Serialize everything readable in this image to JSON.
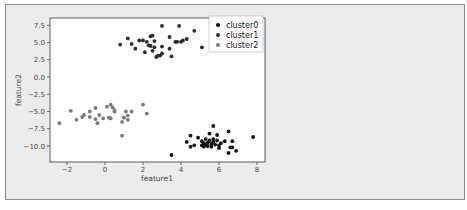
{
  "chart_data": {
    "type": "scatter",
    "title": "",
    "xlabel": "feature1",
    "ylabel": "feature2",
    "xlim": [
      -2.8,
      8.4
    ],
    "ylim": [
      -12.2,
      8.3
    ],
    "xticks": [
      -2,
      0,
      2,
      4,
      6,
      8
    ],
    "xtick_labels": [
      "−2",
      "0",
      "2",
      "4",
      "6",
      "8"
    ],
    "yticks": [
      7.5,
      5.0,
      2.5,
      0.0,
      -2.5,
      -5.0,
      -7.5,
      -10.0
    ],
    "ytick_labels": [
      "7.5",
      "5.0",
      "2.5",
      "0.0",
      "−2.5",
      "−5.0",
      "−7.5",
      "−10.0"
    ],
    "grid": false,
    "legend_position": "upper right",
    "series": [
      {
        "name": "cluster0",
        "color": "#111111",
        "points": [
          [
            3.5,
            -11.3
          ],
          [
            4.3,
            -9.4
          ],
          [
            4.5,
            -8.5
          ],
          [
            4.5,
            -10.1
          ],
          [
            4.7,
            -9.9
          ],
          [
            4.9,
            -8.8
          ],
          [
            5.1,
            -9.3
          ],
          [
            5.1,
            -9.9
          ],
          [
            5.2,
            -9.6
          ],
          [
            5.2,
            -10.1
          ],
          [
            5.3,
            -9.0
          ],
          [
            5.3,
            -9.8
          ],
          [
            5.4,
            -9.5
          ],
          [
            5.4,
            -10.0
          ],
          [
            5.5,
            -8.2
          ],
          [
            5.5,
            -9.2
          ],
          [
            5.6,
            -9.7
          ],
          [
            5.6,
            -10.1
          ],
          [
            5.7,
            -7.1
          ],
          [
            5.7,
            -9.0
          ],
          [
            5.7,
            -9.4
          ],
          [
            5.8,
            -9.8
          ],
          [
            5.9,
            -8.4
          ],
          [
            5.9,
            -9.2
          ],
          [
            6.0,
            -9.9
          ],
          [
            6.0,
            -10.3
          ],
          [
            6.1,
            -9.6
          ],
          [
            6.3,
            -9.3
          ],
          [
            6.5,
            -7.9
          ],
          [
            6.5,
            -11.0
          ],
          [
            6.6,
            -10.2
          ],
          [
            6.7,
            -9.3
          ],
          [
            6.7,
            -10.2
          ],
          [
            6.9,
            -10.7
          ],
          [
            7.8,
            -8.7
          ]
        ]
      },
      {
        "name": "cluster1",
        "color": "#2a2a2a",
        "points": [
          [
            0.8,
            4.7
          ],
          [
            1.2,
            5.6
          ],
          [
            1.4,
            4.8
          ],
          [
            1.6,
            4.1
          ],
          [
            1.8,
            5.3
          ],
          [
            2.0,
            5.3
          ],
          [
            2.1,
            3.6
          ],
          [
            2.2,
            5.1
          ],
          [
            2.3,
            4.6
          ],
          [
            2.4,
            5.9
          ],
          [
            2.4,
            4.5
          ],
          [
            2.5,
            6.0
          ],
          [
            2.5,
            3.8
          ],
          [
            2.6,
            4.3
          ],
          [
            2.6,
            5.2
          ],
          [
            2.7,
            2.9
          ],
          [
            2.8,
            3.1
          ],
          [
            2.9,
            3.1
          ],
          [
            3.0,
            3.4
          ],
          [
            3.0,
            4.4
          ],
          [
            3.0,
            7.4
          ],
          [
            3.4,
            5.8
          ],
          [
            3.4,
            4.1
          ],
          [
            3.5,
            3.0
          ],
          [
            3.7,
            5.1
          ],
          [
            3.8,
            5.1
          ],
          [
            3.9,
            7.4
          ],
          [
            4.0,
            5.1
          ],
          [
            4.1,
            5.3
          ],
          [
            4.3,
            5.5
          ],
          [
            4.7,
            6.7
          ],
          [
            5.1,
            4.3
          ]
        ]
      },
      {
        "name": "cluster2",
        "color": "#7a7a7a",
        "points": [
          [
            -2.4,
            -6.7
          ],
          [
            -1.8,
            -4.9
          ],
          [
            -1.5,
            -6.2
          ],
          [
            -1.2,
            -5.8
          ],
          [
            -1.1,
            -5.5
          ],
          [
            -0.8,
            -5.0
          ],
          [
            -0.8,
            -5.8
          ],
          [
            -0.5,
            -4.5
          ],
          [
            -0.5,
            -6.1
          ],
          [
            -0.4,
            -6.7
          ],
          [
            -0.3,
            -5.5
          ],
          [
            -0.1,
            -6.0
          ],
          [
            0.1,
            -4.3
          ],
          [
            0.2,
            -5.9
          ],
          [
            0.3,
            -6.0
          ],
          [
            0.3,
            -4.0
          ],
          [
            0.4,
            -4.4
          ],
          [
            0.5,
            -5.0
          ],
          [
            0.5,
            -4.8
          ],
          [
            0.9,
            -6.5
          ],
          [
            0.9,
            -8.5
          ],
          [
            1.0,
            -5.9
          ],
          [
            1.1,
            -5.0
          ],
          [
            1.2,
            -6.2
          ],
          [
            1.2,
            -5.6
          ],
          [
            1.4,
            -5.0
          ],
          [
            2.0,
            -4.0
          ],
          [
            2.2,
            -5.3
          ]
        ]
      }
    ]
  }
}
